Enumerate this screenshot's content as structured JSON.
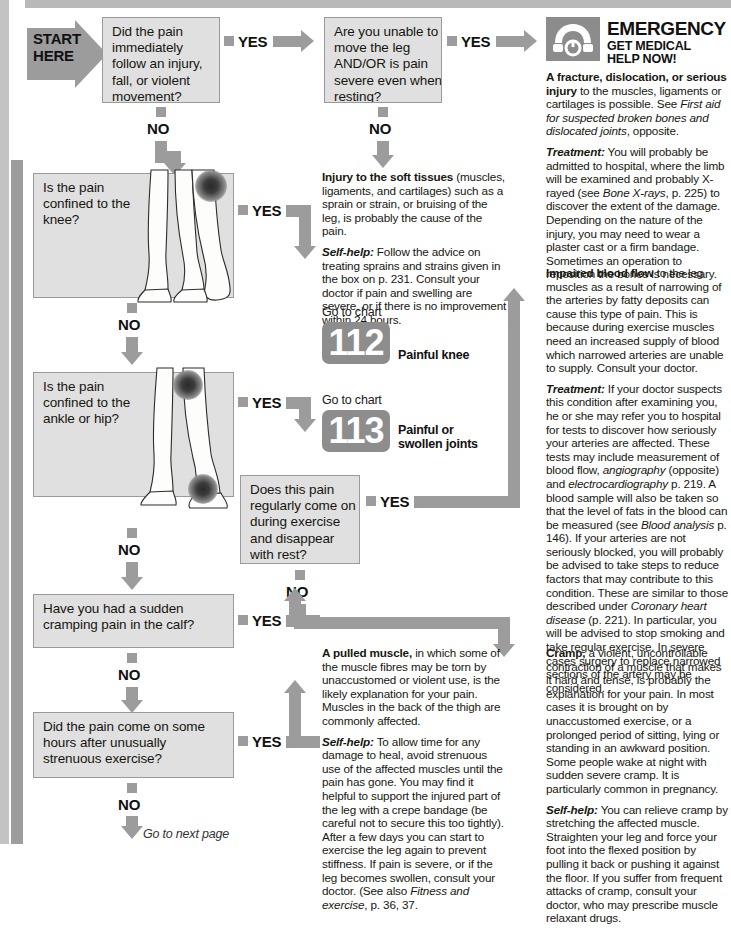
{
  "page": {
    "start_label_line1": "START",
    "start_label_line2": "HERE",
    "next_page": "Go to next page"
  },
  "answers": {
    "yes": "YES",
    "no": "NO"
  },
  "questions": [
    {
      "id": "q1",
      "text": "Did the pain immediately follow an injury, fall, or violent movement?",
      "yes": "YES",
      "no": "NO"
    },
    {
      "id": "q2",
      "text": "Are you unable to move the leg AND/OR is pain severe even when resting?",
      "yes": "YES",
      "no": "NO"
    },
    {
      "id": "q3",
      "text": "Is the pain confined to the knee?",
      "yes": "YES",
      "no": "NO"
    },
    {
      "id": "q4",
      "text": "Is the pain confined to the ankle or hip?",
      "yes": "YES",
      "no": "NO"
    },
    {
      "id": "q5",
      "text": "Does this pain regularly come on during exercise and disappear with rest?",
      "yes": "YES",
      "no": "NO"
    },
    {
      "id": "q6",
      "text": "Have you had a sudden cramping pain in the calf?",
      "yes": "YES",
      "no": "NO"
    },
    {
      "id": "q7",
      "text": "Did the pain come on some hours after unusually strenuous exercise?",
      "yes": "YES",
      "no": "NO"
    }
  ],
  "emergency": {
    "icon": "telephone-icon",
    "title": "EMERGENCY",
    "subtitle_line1": "GET MEDICAL",
    "subtitle_line2": "HELP NOW!"
  },
  "charts": [
    {
      "goto": "Go to chart",
      "number": "112",
      "caption": "Painful knee"
    },
    {
      "goto": "Go to chart",
      "number": "113",
      "caption_line1": "Painful or",
      "caption_line2": "swollen joints"
    }
  ],
  "panels": {
    "emergency_body": {
      "p1_lead": "A fracture, dislocation, or serious injury",
      "p1_rest": " to the muscles, ligaments or cartilages is possible. See ",
      "p1_italic": "First aid for suspected broken bones and dislocated joints",
      "p1_tail": ", opposite.",
      "p2_lead": "Treatment:",
      "p2_a": " You will probably be admitted to hospital, where the limb will be examined and probably X-rayed (see ",
      "p2_italic": "Bone X-rays",
      "p2_b": ", p. 225) to discover the extent of the damage. Depending on the nature of the injury, you may need to wear a plaster cast or a firm bandage. Sometimes an operation to reposition the bones is necessary."
    },
    "soft_tissue": {
      "p1_lead": "Injury to the soft tissues",
      "p1_rest": " (muscles, ligaments, and cartilages) such as a sprain or strain, or bruising of the leg, is probably the cause of the pain.",
      "p2_lead": "Self-help:",
      "p2_rest": " Follow the advice on treating sprains and strains given in the box on p. 231. Consult your doctor if pain and swelling are severe, or if there is no improvement within 24 hours."
    },
    "impaired_blood_flow": {
      "p1_lead": "Impaired blood flow",
      "p1_rest": " to the leg muscles as a result of narrowing of the arteries by fatty deposits can cause this type of pain. This is because during exercise muscles need an increased supply of blood which narrowed arteries are unable to supply. Consult your doctor.",
      "p2_lead": "Treatment:",
      "p2_a": " If your doctor suspects this condition after examining you, he or she may refer you to hospital for tests to discover how seriously your arteries are affected. These tests may include measurement of blood flow, ",
      "p2_i1": "angiography",
      "p2_b": " (opposite) and ",
      "p2_i2": "electrocardiography",
      "p2_c": " p. 219. A blood sample will also be taken so that the level of fats in the blood can be measured (see ",
      "p2_i3": "Blood analysis",
      "p2_d": " p. 146). If your arteries are not seriously blocked, you will probably be advised to take steps to reduce factors that may contribute to this condition. These are similar to those described under ",
      "p2_i4": "Coronary heart disease",
      "p2_e": " (p. 221). In particular, you will be advised to stop smoking and take regular exercise. In severe cases surgery to replace narrowed sections of the artery may be considered."
    },
    "pulled_muscle": {
      "p1_lead": "A pulled muscle,",
      "p1_rest": " in which some of the muscle fibres may be torn by unaccustomed or violent use, is the likely explanation for your pain. Muscles in the back of the thigh are commonly affected.",
      "p2_lead": "Self-help:",
      "p2_a": " To allow time for any damage to heal, avoid strenuous use of the affected muscles until the pain has gone. You may find it helpful to support the injured part of the leg with a crepe bandage (be careful not to secure this too tightly). After a few days you can start to exercise the leg again to prevent stiffness. If pain is severe, or if the leg becomes swollen, consult your doctor. (See also ",
      "p2_i1": "Fitness and exercise",
      "p2_b": ", p. 36, 37."
    },
    "cramp": {
      "p1_lead": "Cramp,",
      "p1_rest": " a violent, uncontrollable contraction of a muscle that makes it hard and tense, is probably the explanation for your pain. In most cases it is brought on by unaccustomed exercise, or a prolonged period of sitting, lying or standing in an awkward position. Some people wake at night with sudden severe cramp. It is particularly common in pregnancy.",
      "p2_lead": "Self-help:",
      "p2_rest": " You can relieve cramp by stretching the affected muscle. Straighten your leg and force your foot into the flexed position by pulling it back or pushing it against the floor. If you suffer from frequent attacks of cramp, consult your doctor, who may prescribe muscle relaxant drugs."
    }
  },
  "colors": {
    "arrow_grey": "#9c9c9c",
    "box_fill": "#e0e0e0",
    "box_border": "#9a9a9a",
    "chart_badge": "#8d8d8d",
    "page_rule": "#b9b9b9"
  }
}
